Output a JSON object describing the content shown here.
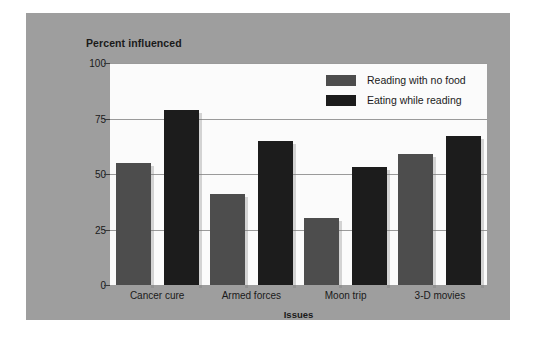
{
  "chart_data": {
    "type": "bar",
    "title": "Percent influenced",
    "xlabel": "Issues",
    "ylabel": "",
    "categories": [
      "Cancer cure",
      "Armed forces",
      "Moon trip",
      "3-D movies"
    ],
    "series": [
      {
        "name": "Reading with no food",
        "color": "#4d4d4d",
        "values": [
          55,
          41,
          30,
          59
        ]
      },
      {
        "name": "Eating while reading",
        "color": "#1c1c1c",
        "values": [
          79,
          65,
          53,
          67
        ]
      }
    ],
    "ylim": [
      0,
      100
    ],
    "yticks": [
      0,
      25,
      50,
      75,
      100
    ],
    "ytick_labels": [
      "0",
      "25",
      "50",
      "75",
      "100"
    ],
    "grid": true,
    "legend_position": "top-right",
    "panel_color": "#9e9e9e",
    "plot_background": "#fbfbfb"
  }
}
